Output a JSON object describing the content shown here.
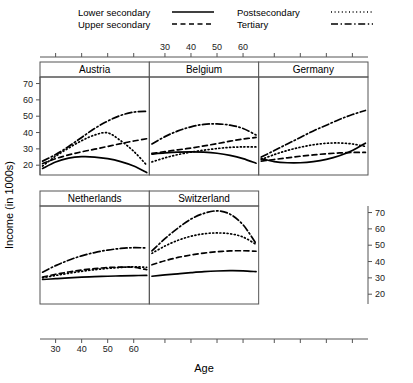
{
  "chart_data": {
    "type": "line",
    "title": "",
    "xlabel": "Age",
    "ylabel": "Income (in 1000s)",
    "xlim": [
      24,
      66
    ],
    "ylim": [
      14,
      74
    ],
    "xticks": [
      30,
      40,
      50,
      60
    ],
    "yticks": [
      20,
      30,
      40,
      50,
      60,
      70
    ],
    "grid": false,
    "legend_position": "top",
    "panel_layout": "trellis 3 columns x 2 rows",
    "series_styles": {
      "Lower secondary": "solid",
      "Upper secondary": "dashed",
      "Postsecondary": "dotted",
      "Tertiary": "dash-dot"
    },
    "x": [
      25,
      30,
      35,
      40,
      45,
      50,
      55,
      60,
      65
    ],
    "panels": [
      {
        "name": "Austria",
        "series": [
          {
            "name": "Lower secondary",
            "style": "solid",
            "values": [
              18.0,
              22.0,
              24.3,
              25.2,
              25.0,
              24.0,
              22.2,
              19.5,
              15.5
            ]
          },
          {
            "name": "Upper secondary",
            "style": "dashed",
            "values": [
              21.0,
              24.0,
              26.3,
              28.2,
              29.8,
              31.5,
              33.2,
              34.8,
              36.2
            ]
          },
          {
            "name": "Postsecondary",
            "style": "dotted",
            "values": [
              19.5,
              25.5,
              30.5,
              35.0,
              38.5,
              39.8,
              35.0,
              28.5,
              20.0
            ]
          },
          {
            "name": "Tertiary",
            "style": "dash-dot",
            "values": [
              22.5,
              26.5,
              31.5,
              37.0,
              42.5,
              47.0,
              50.5,
              52.5,
              53.0
            ]
          }
        ]
      },
      {
        "name": "Belgium",
        "series": [
          {
            "name": "Lower secondary",
            "style": "solid",
            "values": [
              26.8,
              27.5,
              28.0,
              28.2,
              28.0,
              27.3,
              26.0,
              24.0,
              21.2
            ]
          },
          {
            "name": "Upper secondary",
            "style": "dashed",
            "values": [
              27.2,
              28.3,
              29.4,
              30.5,
              31.8,
              33.2,
              34.7,
              36.0,
              37.0
            ]
          },
          {
            "name": "Postsecondary",
            "style": "dotted",
            "values": [
              22.0,
              24.5,
              26.5,
              28.0,
              29.2,
              30.2,
              30.9,
              31.2,
              31.2
            ]
          },
          {
            "name": "Tertiary",
            "style": "dash-dot",
            "values": [
              33.0,
              37.5,
              41.0,
              43.5,
              45.0,
              45.3,
              44.5,
              42.5,
              38.5
            ]
          }
        ]
      },
      {
        "name": "Germany",
        "series": [
          {
            "name": "Lower secondary",
            "style": "solid",
            "values": [
              24.0,
              22.2,
              21.5,
              21.5,
              22.2,
              23.6,
              25.8,
              29.0,
              33.5
            ]
          },
          {
            "name": "Upper secondary",
            "style": "dashed",
            "values": [
              22.5,
              23.5,
              24.5,
              25.5,
              26.3,
              27.0,
              27.5,
              27.8,
              27.8
            ]
          },
          {
            "name": "Postsecondary",
            "style": "dotted",
            "values": [
              23.5,
              26.5,
              29.0,
              31.0,
              32.5,
              33.4,
              33.6,
              33.0,
              31.5
            ]
          },
          {
            "name": "Tertiary",
            "style": "dash-dot",
            "values": [
              25.0,
              29.0,
              33.0,
              37.0,
              41.0,
              44.5,
              48.0,
              51.0,
              53.5
            ]
          }
        ]
      },
      {
        "name": "Netherlands",
        "series": [
          {
            "name": "Lower secondary",
            "style": "solid",
            "values": [
              29.0,
              29.5,
              30.0,
              30.4,
              30.7,
              31.0,
              31.2,
              31.4,
              31.5
            ]
          },
          {
            "name": "Upper secondary",
            "style": "dashed",
            "values": [
              30.5,
              32.2,
              33.6,
              34.8,
              35.7,
              36.3,
              36.6,
              36.5,
              35.0
            ]
          },
          {
            "name": "Postsecondary",
            "style": "dotted",
            "values": [
              30.0,
              31.5,
              32.8,
              34.0,
              35.0,
              35.8,
              36.4,
              36.8,
              36.5
            ]
          },
          {
            "name": "Tertiary",
            "style": "dash-dot",
            "values": [
              33.5,
              37.5,
              40.8,
              43.5,
              45.5,
              47.0,
              48.0,
              48.5,
              48.3
            ]
          }
        ]
      },
      {
        "name": "Switzerland",
        "series": [
          {
            "name": "Lower secondary",
            "style": "solid",
            "values": [
              31.0,
              31.8,
              32.5,
              33.2,
              33.8,
              34.2,
              34.4,
              34.3,
              33.8
            ]
          },
          {
            "name": "Upper secondary",
            "style": "dashed",
            "values": [
              38.0,
              40.5,
              42.5,
              44.0,
              45.2,
              46.0,
              46.5,
              46.6,
              46.3
            ]
          },
          {
            "name": "Postsecondary",
            "style": "dotted",
            "values": [
              45.0,
              49.5,
              53.0,
              55.5,
              57.0,
              57.5,
              57.0,
              55.0,
              50.5
            ]
          },
          {
            "name": "Tertiary",
            "style": "dash-dot",
            "values": [
              46.5,
              54.0,
              60.5,
              66.0,
              69.5,
              71.0,
              69.0,
              62.5,
              51.0
            ]
          }
        ]
      }
    ]
  },
  "legend": {
    "items": [
      {
        "label": "Lower secondary",
        "style": "solid"
      },
      {
        "label": "Upper secondary",
        "style": "dashed"
      },
      {
        "label": "Postsecondary",
        "style": "dotted"
      },
      {
        "label": "Tertiary",
        "style": "dash-dot"
      }
    ]
  },
  "axes": {
    "x_title": "Age",
    "y_title": "Income (in 1000s)",
    "x_tick_labels": [
      "30",
      "40",
      "50",
      "60"
    ],
    "y_tick_labels": [
      "20",
      "30",
      "40",
      "50",
      "60",
      "70"
    ]
  },
  "strips": {
    "austria": "Austria",
    "belgium": "Belgium",
    "germany": "Germany",
    "netherlands": "Netherlands",
    "switzerland": "Switzerland"
  }
}
